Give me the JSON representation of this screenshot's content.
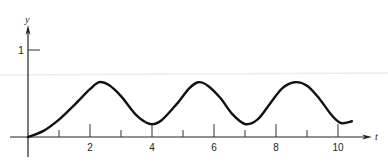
{
  "chart_data": {
    "type": "line",
    "title": "",
    "xlabel": "t",
    "ylabel": "y",
    "xlim": [
      0,
      11
    ],
    "ylim": [
      0,
      1
    ],
    "grid": false,
    "legend": null,
    "x_ticks": [
      1,
      2,
      3,
      4,
      5,
      6,
      7,
      8,
      9,
      10
    ],
    "x_tick_labels": [
      "2",
      "4",
      "6",
      "8",
      "10"
    ],
    "x_tick_label_values": [
      2,
      4,
      6,
      8,
      10
    ],
    "y_ticks": [
      1
    ],
    "y_tick_labels": [
      "1"
    ],
    "series": [
      {
        "name": "y(t)",
        "x": [
          0,
          0.5,
          1.0,
          1.5,
          2.0,
          2.3,
          2.6,
          3.0,
          3.5,
          3.95,
          4.3,
          4.8,
          5.2,
          5.5,
          5.8,
          6.2,
          6.6,
          7.0,
          7.4,
          7.8,
          8.2,
          8.6,
          9.0,
          9.4,
          9.8,
          10.1,
          10.45
        ],
        "values": [
          0.0,
          0.07,
          0.2,
          0.37,
          0.55,
          0.63,
          0.6,
          0.47,
          0.25,
          0.15,
          0.19,
          0.38,
          0.56,
          0.63,
          0.59,
          0.45,
          0.26,
          0.15,
          0.2,
          0.38,
          0.56,
          0.63,
          0.59,
          0.44,
          0.25,
          0.16,
          0.18
        ]
      }
    ]
  }
}
